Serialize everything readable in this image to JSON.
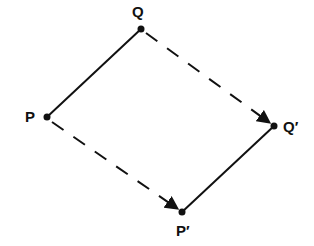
{
  "diagram": {
    "points": {
      "P": {
        "label": "P",
        "x": 47,
        "y": 117
      },
      "Q": {
        "label": "Q",
        "x": 141,
        "y": 29
      },
      "P_prime": {
        "label": "P′",
        "x": 182,
        "y": 212
      },
      "Q_prime": {
        "label": "Q′",
        "x": 274,
        "y": 126
      }
    },
    "segments": [
      {
        "from": "P",
        "to": "Q",
        "style": "solid"
      },
      {
        "from": "P_prime",
        "to": "Q_prime",
        "style": "solid"
      },
      {
        "from": "P",
        "to": "P_prime",
        "style": "dashed-arrow"
      },
      {
        "from": "Q",
        "to": "Q_prime",
        "style": "dashed-arrow"
      }
    ],
    "colors": {
      "line": "#111111",
      "background": "#ffffff"
    }
  }
}
